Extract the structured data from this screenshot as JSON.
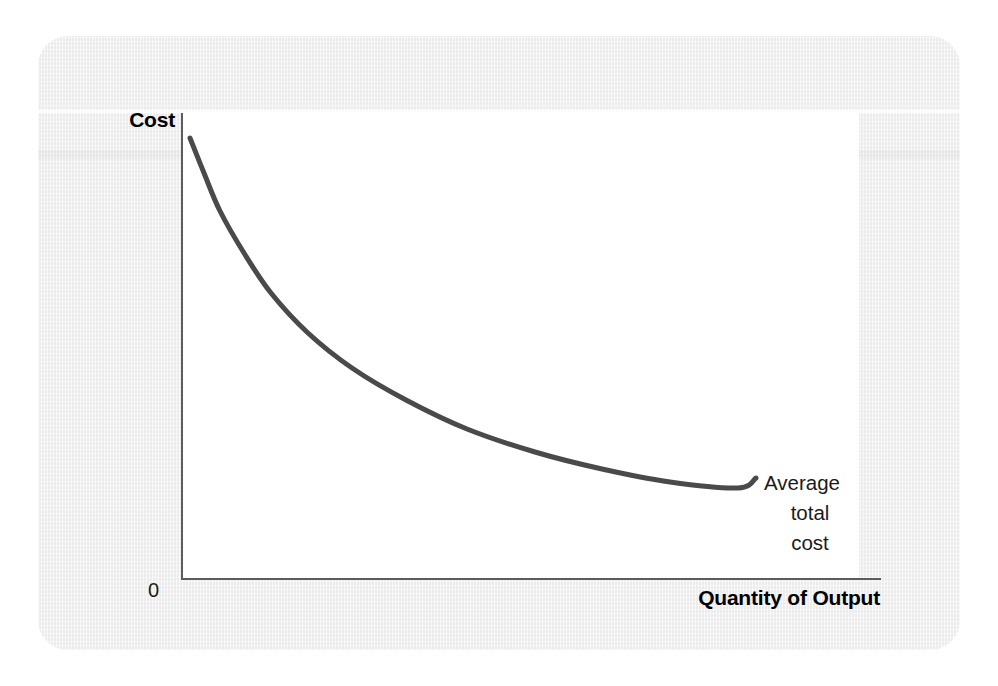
{
  "figure": {
    "background_color": "#ffffff",
    "panel_color": "#f1f1f1",
    "plot_area_color": "#ffffff",
    "axis_color": "#5c5c5c",
    "curve_color": "#4a4a4a"
  },
  "axes": {
    "y_label": "Cost",
    "x_label": "Quantity of Output",
    "origin_label": "0"
  },
  "annotation": {
    "line1": "Average",
    "line2": "total",
    "line3": "cost"
  },
  "chart_data": {
    "type": "line",
    "title": "",
    "subtitle": "",
    "xlabel": "Quantity of Output",
    "ylabel": "Cost",
    "grid": false,
    "legend_position": "inline-right-end-of-curve",
    "axis_tick_labels": {
      "x": [
        "0"
      ],
      "y": []
    },
    "xlim": [
      0,
      1
    ],
    "ylim": [
      0,
      1
    ],
    "annotations": [
      {
        "text": "Average total cost",
        "attached_to_series": "Average total cost",
        "position": "right end of curve"
      }
    ],
    "series": [
      {
        "name": "Average total cost",
        "color": "#4a4a4a",
        "line_width_px": 5,
        "shape": "decreasing convex curve (falling, flattening toward the right)",
        "points_normalized": [
          {
            "x": 0.01,
            "y": 0.945
          },
          {
            "x": 0.03,
            "y": 0.87
          },
          {
            "x": 0.055,
            "y": 0.79
          },
          {
            "x": 0.09,
            "y": 0.7
          },
          {
            "x": 0.13,
            "y": 0.615
          },
          {
            "x": 0.185,
            "y": 0.53
          },
          {
            "x": 0.25,
            "y": 0.455
          },
          {
            "x": 0.33,
            "y": 0.385
          },
          {
            "x": 0.42,
            "y": 0.325
          },
          {
            "x": 0.52,
            "y": 0.275
          },
          {
            "x": 0.62,
            "y": 0.238
          },
          {
            "x": 0.72,
            "y": 0.212
          },
          {
            "x": 0.82,
            "y": 0.198
          },
          {
            "x": 0.85,
            "y": 0.193
          }
        ],
        "points_pixels": [
          {
            "x": 190,
            "y": 138
          },
          {
            "x": 204,
            "y": 173
          },
          {
            "x": 220,
            "y": 211
          },
          {
            "x": 244,
            "y": 253
          },
          {
            "x": 271,
            "y": 293
          },
          {
            "x": 308,
            "y": 333
          },
          {
            "x": 352,
            "y": 368
          },
          {
            "x": 406,
            "y": 400
          },
          {
            "x": 467,
            "y": 429
          },
          {
            "x": 535,
            "y": 452
          },
          {
            "x": 602,
            "y": 469
          },
          {
            "x": 670,
            "y": 482
          },
          {
            "x": 738,
            "y": 488
          },
          {
            "x": 756,
            "y": 478
          }
        ]
      }
    ]
  }
}
